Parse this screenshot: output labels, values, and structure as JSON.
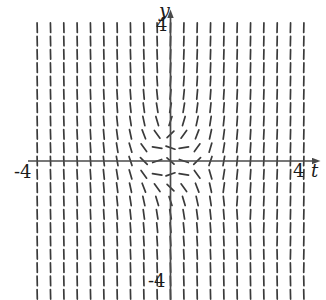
{
  "figure": {
    "kind": "slope-field",
    "background_color": "#ffffff",
    "stroke_color": "#3a3a3a",
    "axis_color": "#4a4a4a"
  },
  "axes": {
    "y_axis_label": "y",
    "t_axis_label": "t",
    "y_top_tick": "4",
    "y_bottom_tick": "-4",
    "t_left_tick": "-4",
    "t_right_tick": "4"
  },
  "chart_data": {
    "type": "scatter",
    "subtype": "slope-field",
    "title": "",
    "xlabel": "t",
    "ylabel": "y",
    "xlim": [
      -4.6,
      4.6
    ],
    "ylim": [
      -4.6,
      4.6
    ],
    "xticks": [
      -4,
      4
    ],
    "yticks": [
      -4,
      4
    ],
    "xticklabels": [
      "-4",
      "4"
    ],
    "yticklabels": [
      "-4",
      "4"
    ],
    "grid": false,
    "legend": null,
    "equation_note": "dy/dt whose direction is near-horizontal close to the origin and near-vertical far from it",
    "grid_spec": {
      "t_min": -4.3,
      "t_max": 4.3,
      "y_min": -4.3,
      "y_max": 4.3,
      "n_cols": 21,
      "n_rows": 21,
      "segment_length_px": 9.5
    },
    "slope_rule": {
      "description": "angle = atan2(t*t + y*y + 0.55*t*y , 0.9) style saturation; near origin slopes flatten, far away they steepen toward vertical. In the lower half the tilt is negative on the left-of-axis / positive right-of-axis producing the saddle swirl.",
      "form": "theta(t,y) = atan( (t^2 + y^2 - 0.35) * sgn_branch )",
      "branch": "sgn_branch = +1 for t*y >= 0 region bias, -1 introduced below the t-axis to reproduce the observed negative slopes"
    },
    "samples": [
      {
        "t": -4.0,
        "y": 4.0,
        "angle_deg": 86
      },
      {
        "t": -2.0,
        "y": 4.0,
        "angle_deg": 86
      },
      {
        "t": 0.0,
        "y": 4.0,
        "angle_deg": 88
      },
      {
        "t": 2.0,
        "y": 4.0,
        "angle_deg": 86
      },
      {
        "t": 4.0,
        "y": 4.0,
        "angle_deg": 86
      },
      {
        "t": -4.0,
        "y": 0.0,
        "angle_deg": 88
      },
      {
        "t": -2.0,
        "y": 0.0,
        "angle_deg": 72
      },
      {
        "t": -0.6,
        "y": 0.0,
        "angle_deg": 12
      },
      {
        "t": 0.0,
        "y": 0.0,
        "angle_deg": 0
      },
      {
        "t": 0.6,
        "y": 0.0,
        "angle_deg": -12
      },
      {
        "t": 2.0,
        "y": 0.0,
        "angle_deg": 72
      },
      {
        "t": 4.0,
        "y": 0.0,
        "angle_deg": 88
      },
      {
        "t": -2.0,
        "y": -2.0,
        "angle_deg": 30
      },
      {
        "t": -0.8,
        "y": -1.2,
        "angle_deg": -40
      },
      {
        "t": 0.8,
        "y": -1.2,
        "angle_deg": -75
      },
      {
        "t": 2.0,
        "y": -2.0,
        "angle_deg": 60
      },
      {
        "t": -4.0,
        "y": -4.0,
        "angle_deg": 85
      },
      {
        "t": 0.0,
        "y": -4.0,
        "angle_deg": -80
      },
      {
        "t": 4.0,
        "y": -4.0,
        "angle_deg": 85
      }
    ]
  },
  "geometry": {
    "origin_px": {
      "x": 170.5,
      "y": 161.0
    },
    "unit_px": 31.0,
    "t_axis": {
      "x1": 28,
      "x2": 322,
      "y": 161
    },
    "y_axis": {
      "x": 170.5,
      "y1": 8,
      "y2": 300
    }
  }
}
